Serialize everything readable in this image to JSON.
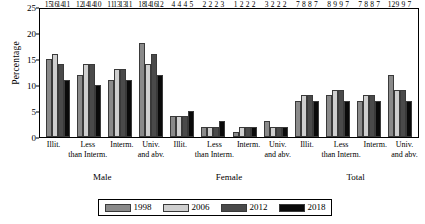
{
  "chart_data": {
    "type": "bar",
    "title": "",
    "xlabel": "",
    "ylabel": "Percentage",
    "ylim": [
      0,
      25
    ],
    "yticks": [
      0,
      5,
      10,
      15,
      20,
      25
    ],
    "grid": false,
    "legend_position": "bottom",
    "series": [
      {
        "name": "1998",
        "color": "#8a8a8a"
      },
      {
        "name": "2006",
        "color": "#cfcfcf"
      },
      {
        "name": "2012",
        "color": "#4a4a4a"
      },
      {
        "name": "2018",
        "color": "#0a0a0a"
      }
    ],
    "groups": [
      {
        "name": "Male",
        "categories": [
          {
            "label_line1": "Illit.",
            "label_line2": "",
            "values": [
              15,
              16,
              14,
              11
            ]
          },
          {
            "label_line1": "Less",
            "label_line2": "than Interm.",
            "values": [
              12,
              14,
              14,
              10
            ]
          },
          {
            "label_line1": "Interm.",
            "label_line2": "",
            "values": [
              11,
              13,
              13,
              11
            ]
          },
          {
            "label_line1": "Univ.",
            "label_line2": "and abv.",
            "values": [
              18,
              14,
              16,
              12
            ]
          }
        ]
      },
      {
        "name": "Female",
        "categories": [
          {
            "label_line1": "Illit.",
            "label_line2": "",
            "values": [
              4,
              4,
              4,
              5
            ]
          },
          {
            "label_line1": "Less",
            "label_line2": "than Interm.",
            "values": [
              2,
              2,
              2,
              3
            ]
          },
          {
            "label_line1": "Interm.",
            "label_line2": "",
            "values": [
              1,
              2,
              2,
              2
            ]
          },
          {
            "label_line1": "Univ.",
            "label_line2": "and abv.",
            "values": [
              3,
              2,
              2,
              2
            ]
          }
        ]
      },
      {
        "name": "Total",
        "categories": [
          {
            "label_line1": "Illit.",
            "label_line2": "",
            "values": [
              7,
              8,
              8,
              7
            ]
          },
          {
            "label_line1": "Less",
            "label_line2": "than Interm.",
            "values": [
              8,
              9,
              9,
              7
            ]
          },
          {
            "label_line1": "Interm.",
            "label_line2": "",
            "values": [
              7,
              8,
              8,
              7
            ]
          },
          {
            "label_line1": "Univ.",
            "label_line2": "and abv.",
            "values": [
              12,
              9,
              9,
              7
            ]
          }
        ]
      }
    ]
  }
}
